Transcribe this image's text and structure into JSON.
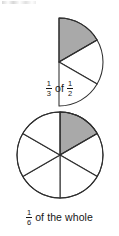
{
  "page": {
    "background_color": "#ffffff",
    "width": 119,
    "height": 236
  },
  "style": {
    "shade_color": "#a9a9a9",
    "stroke_color": "#2f2f2f",
    "text_color": "#161616"
  },
  "figures": [
    {
      "id": "half-disk-thirds",
      "type": "sector-diagram",
      "shape": "half-disk",
      "center": {
        "x": 59,
        "y": 62
      },
      "radius": 44,
      "total_sectors": 3,
      "shaded_sectors": 1,
      "span_degrees": 180,
      "start_angle_degrees": -90,
      "shaded_index": 0,
      "caption": {
        "fraction_a": {
          "numerator": "1",
          "denominator": "3"
        },
        "connector": "of",
        "fraction_b": {
          "numerator": "1",
          "denominator": "2"
        }
      }
    },
    {
      "id": "whole-circle-sixths",
      "type": "sector-diagram",
      "shape": "circle",
      "center": {
        "x": 60,
        "y": 155
      },
      "radius": 43,
      "total_sectors": 6,
      "shaded_sectors": 1,
      "span_degrees": 360,
      "start_angle_degrees": -90,
      "shaded_index": 0,
      "caption": {
        "fraction_a": {
          "numerator": "1",
          "denominator": "6"
        },
        "connector": "of the whole"
      }
    }
  ],
  "captions": {
    "top": {
      "frac1_num": "1",
      "frac1_den": "3",
      "word": "of",
      "frac2_num": "1",
      "frac2_den": "2"
    },
    "bottom": {
      "frac1_num": "1",
      "frac1_den": "6",
      "word": "of the whole"
    }
  }
}
